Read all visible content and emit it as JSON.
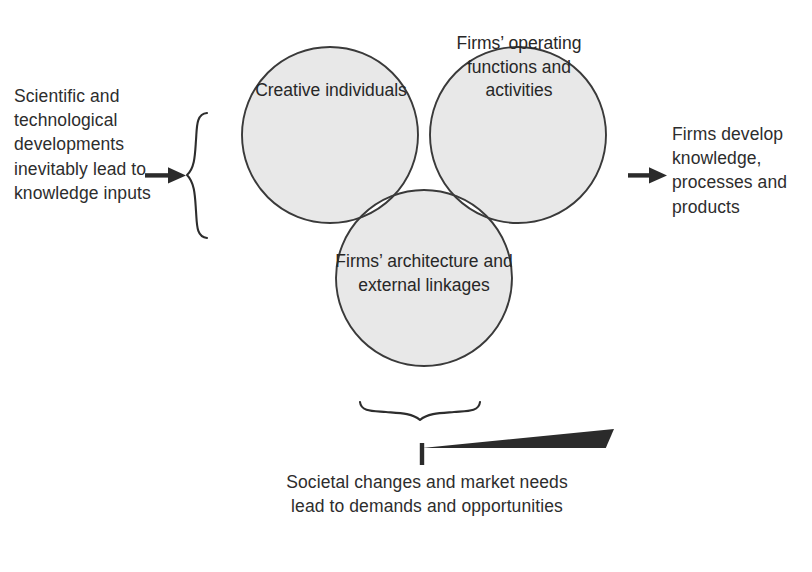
{
  "figure": {
    "type": "venn-diagram",
    "circle_fill_color": "#e8e8e8",
    "circle_overlap_fill_color": "#ffffff",
    "circle_stroke_color": "#3a3a3a",
    "text_color": "#2d2d2d",
    "background_color": "#ffffff"
  },
  "left": {
    "caption": "Scientific and technological developments inevitably lead to knowledge inputs",
    "arrow_direction": "right",
    "brace_orientation": "left-opening"
  },
  "right": {
    "caption": "Firms develop knowledge, processes and products",
    "arrow_direction": "right"
  },
  "bottom": {
    "caption": "Societal changes and market needs lead to demands and opportunities",
    "arrow_direction": "up",
    "brace_orientation": "down-opening"
  },
  "circles": [
    {
      "id": "creative-individuals",
      "label": "Creative individuals",
      "position": "top-left",
      "cx": 330,
      "cy": 135,
      "r": 88
    },
    {
      "id": "firms-operating",
      "label": "Firms’ operating functions and activities",
      "position": "top-right",
      "cx": 518,
      "cy": 135,
      "r": 88
    },
    {
      "id": "firms-architecture",
      "label": "Firms’ architecture and external linkages",
      "position": "bottom-center",
      "cx": 424,
      "cy": 278,
      "r": 88
    }
  ]
}
